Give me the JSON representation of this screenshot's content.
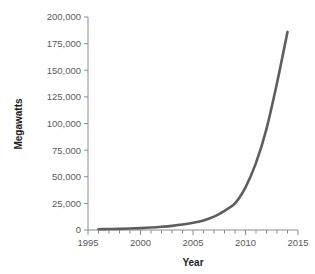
{
  "chart_data": {
    "type": "line",
    "title": "",
    "subtitle": "",
    "xlabel": "Year",
    "ylabel": "Megawatts",
    "xlim": [
      1995,
      2015
    ],
    "ylim": [
      0,
      200000
    ],
    "grid": false,
    "legend": false,
    "legend_position": "none",
    "x_ticks_major": [
      1995,
      2000,
      2005,
      2010,
      2015
    ],
    "x_tick_labels": [
      "1995",
      "2000",
      "2005",
      "2010",
      "2015"
    ],
    "x_minor_tick_step": 1,
    "y_ticks": [
      0,
      25000,
      50000,
      75000,
      100000,
      125000,
      150000,
      175000,
      200000
    ],
    "y_tick_labels": [
      "0",
      "25,000",
      "50,000",
      "75,000",
      "100,000",
      "125,000",
      "150,000",
      "175,000",
      "200,000"
    ],
    "series": [
      {
        "name": "Installed capacity",
        "color": "#5e5e5e",
        "line_width": 2.6,
        "x": [
          1996,
          1997,
          1998,
          1999,
          2000,
          2001,
          2002,
          2003,
          2004,
          2005,
          2006,
          2007,
          2008,
          2009,
          2010,
          2011,
          2012,
          2013,
          2014
        ],
        "values": [
          700,
          900,
          1100,
          1400,
          1800,
          2300,
          3000,
          3900,
          5100,
          6800,
          9000,
          12500,
          18000,
          25000,
          40000,
          63000,
          95000,
          138000,
          186000
        ]
      }
    ],
    "annotations": []
  },
  "axes": {
    "y_axis_title": "Megawatts",
    "x_axis_title": "Year",
    "axis_color": "#8c8c8c",
    "tick_label_color": "#5b5b5b",
    "axis_title_color": "#1d1d1d"
  }
}
